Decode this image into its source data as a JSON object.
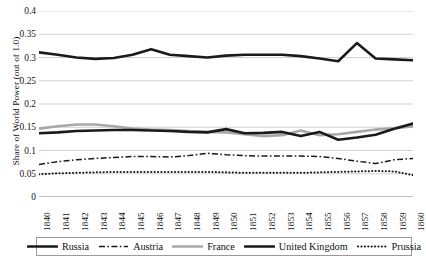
{
  "chart_data": {
    "type": "line",
    "title": "",
    "xlabel": "",
    "ylabel": "Share of World Power (out of 1.0)",
    "ylim": [
      0,
      0.4
    ],
    "ytick_labels": [
      "0.4",
      "0.35",
      "0.3",
      "0.25",
      "0.2",
      "0.15",
      "0.1",
      "0.05",
      "0"
    ],
    "ytick_values": [
      0.4,
      0.35,
      0.3,
      0.25,
      0.2,
      0.15,
      0.1,
      0.05,
      0
    ],
    "grid": true,
    "legend_position": "bottom",
    "categories": [
      "1840",
      "1841",
      "1842",
      "1843",
      "1844",
      "1845",
      "1846",
      "1847",
      "1848",
      "1849",
      "1850",
      "1851",
      "1852",
      "1853",
      "1854",
      "1855",
      "1856",
      "1857",
      "1858",
      "1859",
      "1860"
    ],
    "series": [
      {
        "name": "Russia",
        "style": "solid-thick-black",
        "color": "#1a1a1a",
        "values": [
          0.137,
          0.139,
          0.142,
          0.143,
          0.144,
          0.144,
          0.143,
          0.142,
          0.14,
          0.139,
          0.146,
          0.137,
          0.138,
          0.14,
          0.131,
          0.14,
          0.123,
          0.128,
          0.134,
          0.147,
          0.158
        ]
      },
      {
        "name": "Austria",
        "style": "dash-dot-black",
        "color": "#1a1a1a",
        "values": [
          0.07,
          0.076,
          0.08,
          0.083,
          0.085,
          0.087,
          0.087,
          0.086,
          0.089,
          0.094,
          0.091,
          0.089,
          0.088,
          0.088,
          0.088,
          0.087,
          0.083,
          0.077,
          0.072,
          0.08,
          0.083
        ]
      },
      {
        "name": "France",
        "style": "solid-thick-gray",
        "color": "#a8a8a8",
        "values": [
          0.147,
          0.152,
          0.156,
          0.156,
          0.152,
          0.147,
          0.145,
          0.144,
          0.142,
          0.14,
          0.139,
          0.135,
          0.131,
          0.133,
          0.143,
          0.133,
          0.135,
          0.14,
          0.145,
          0.148,
          0.152
        ]
      },
      {
        "name": "United Kingdom",
        "style": "solid-thick-black",
        "color": "#1a1a1a",
        "values": [
          0.311,
          0.306,
          0.3,
          0.297,
          0.299,
          0.306,
          0.318,
          0.306,
          0.303,
          0.3,
          0.304,
          0.306,
          0.306,
          0.306,
          0.303,
          0.298,
          0.292,
          0.331,
          0.298,
          0.296,
          0.294
        ]
      },
      {
        "name": "Prussia",
        "style": "dotted-black",
        "color": "#1a1a1a",
        "values": [
          0.049,
          0.051,
          0.052,
          0.053,
          0.054,
          0.054,
          0.054,
          0.054,
          0.054,
          0.054,
          0.053,
          0.052,
          0.052,
          0.052,
          0.052,
          0.053,
          0.054,
          0.055,
          0.056,
          0.055,
          0.047
        ]
      }
    ]
  },
  "legend": {
    "items": [
      {
        "label": "Russia",
        "style": "solid-thick-black"
      },
      {
        "label": "Austria",
        "style": "dash-dot-black"
      },
      {
        "label": "France",
        "style": "solid-thick-gray"
      },
      {
        "label": "United Kingdom",
        "style": "solid-thick-black"
      },
      {
        "label": "Prussia",
        "style": "dotted-black"
      }
    ]
  },
  "colors": {
    "black": "#1a1a1a",
    "gray": "#a8a8a8",
    "grid": "#bdbdbd",
    "axis": "#808080",
    "text": "#111111"
  }
}
